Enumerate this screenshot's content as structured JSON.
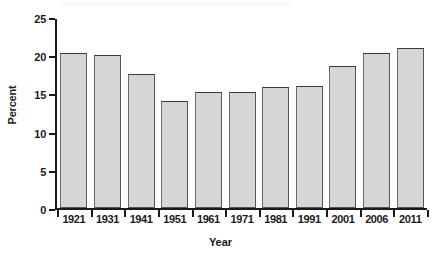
{
  "chart_data": {
    "type": "bar",
    "title": "",
    "xlabel": "Year",
    "ylabel": "Percent",
    "categories": [
      "1921",
      "1931",
      "1941",
      "1951",
      "1961",
      "1971",
      "1981",
      "1991",
      "2001",
      "2006",
      "2011"
    ],
    "values": [
      20.5,
      20.3,
      17.7,
      14.1,
      15.3,
      15.3,
      16.0,
      16.1,
      18.8,
      20.5,
      21.2
    ],
    "ylim": [
      0,
      25
    ],
    "yticks": [
      0,
      5,
      10,
      15,
      20,
      25
    ],
    "ytick_labels": [
      "0",
      "5",
      "10",
      "15",
      "20",
      "25"
    ],
    "grid": false,
    "legend": false,
    "bar_fill_color": "#d6d6d6",
    "bar_border_color": "#555555",
    "axis_color": "#1a1a1a"
  }
}
